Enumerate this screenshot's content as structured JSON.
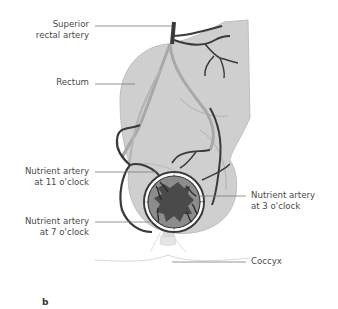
{
  "figure": {
    "panel_letter": "b",
    "labels": {
      "superior_rectal_artery": [
        "Superior",
        "rectal artery"
      ],
      "rectum": [
        "Rectum"
      ],
      "nutrient_11": [
        "Nutrient artery",
        "at 11 o'clock"
      ],
      "nutrient_7": [
        "Nutrient artery",
        "at 7 o'clock"
      ],
      "nutrient_3": [
        "Nutrient artery",
        "at 3 o'clock"
      ],
      "coccyx": [
        "Coccyx"
      ]
    },
    "colors": {
      "rectum_fill": "#cfcfcf",
      "rectum_stroke": "#9a9a9a",
      "artery_dark": "#3a3a3a",
      "artery_light": "#a8a8a8",
      "lumen_fill": "#4a4a4a",
      "mucosa_fill": "#8c8c8c",
      "leader_line": "#6a6a6a",
      "text": "#4a4a4a"
    }
  }
}
